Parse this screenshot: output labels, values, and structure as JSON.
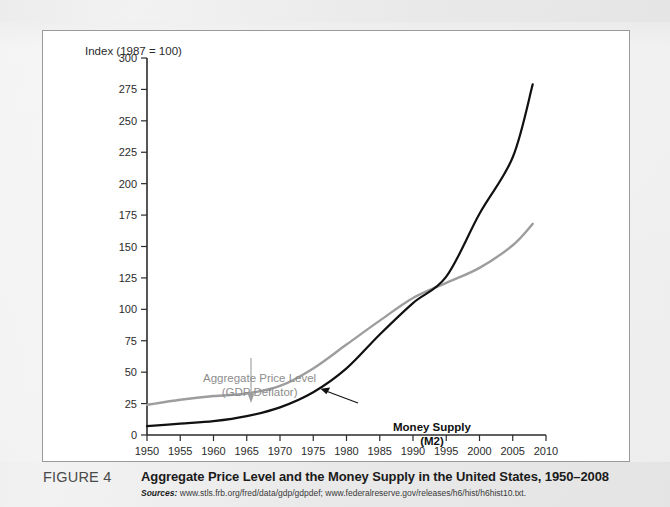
{
  "figure": {
    "label": "FIGURE 4",
    "title": "Aggregate Price Level and the Money Supply in the United States, 1950–2008",
    "sources_label": "Sources:",
    "sources_text": " www.stls.frb.org/fred/data/gdp/gdpdef; www.federalreserve.gov/releases/h6/hist/h6hist10.txt."
  },
  "annotations": {
    "price_line1": "Aggregate Price Level",
    "price_line2": "(GDP Deflator)",
    "money_line1": "Money Supply",
    "money_line2": "(M2)"
  },
  "colors": {
    "money_supply": "#111111",
    "price_level": "#9d9d9d",
    "axis": "#2b2b2b",
    "panel_background": "#ffffff",
    "page_background": "#e8e8e8"
  },
  "chart_data": {
    "type": "line",
    "title": "Aggregate Price Level and the Money Supply in the United States, 1950–2008",
    "xlabel": "",
    "ylabel": "Index (1987 = 100)",
    "xlim": [
      1950,
      2010
    ],
    "ylim": [
      0,
      300
    ],
    "yticks": [
      0,
      25,
      50,
      75,
      100,
      125,
      150,
      175,
      200,
      225,
      250,
      275,
      300
    ],
    "xticks": [
      1950,
      1955,
      1960,
      1965,
      1970,
      1975,
      1980,
      1985,
      1990,
      1995,
      2000,
      2005,
      2010
    ],
    "grid": false,
    "legend": "inline-annotations",
    "x": [
      1950,
      1955,
      1960,
      1965,
      1970,
      1975,
      1980,
      1985,
      1990,
      1995,
      2000,
      2005,
      2008
    ],
    "series": [
      {
        "name": "Aggregate Price Level (GDP Deflator)",
        "color": "#9d9d9d",
        "values": [
          24,
          28,
          31,
          33,
          39,
          53,
          72,
          91,
          109,
          121,
          133,
          151,
          168
        ]
      },
      {
        "name": "Money Supply (M2)",
        "color": "#111111",
        "values": [
          7,
          9,
          11,
          15,
          22,
          34,
          53,
          80,
          105,
          126,
          176,
          221,
          279
        ]
      }
    ]
  }
}
